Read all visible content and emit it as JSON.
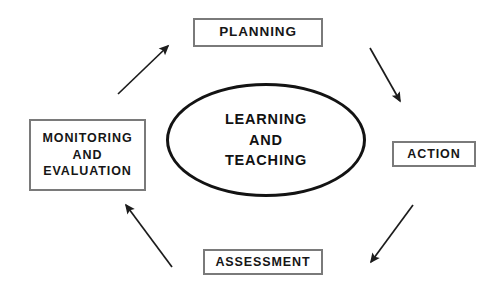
{
  "diagram": {
    "title_text": "Learning and teaching cycle",
    "background_color": "#ffffff",
    "box_border_color": "#7a7a7a",
    "ellipse_border_color": "#131313",
    "arrow_color": "#1c1c1c",
    "text_color": "#161616"
  },
  "center": {
    "name": "learning-and-teaching",
    "line1": "LEARNING",
    "line2": "AND",
    "line3": "TEACHING"
  },
  "nodes": {
    "planning": {
      "label": "PLANNING"
    },
    "action": {
      "label": "ACTION"
    },
    "assessment": {
      "label": "ASSESSMENT"
    },
    "monitoring": {
      "line1": "MONITORING",
      "line2": "AND",
      "line3": "EVALUATION"
    }
  },
  "arrows": [
    {
      "name": "arrow-monitoring-to-planning",
      "from": "MONITORING AND EVALUATION",
      "to": "PLANNING",
      "direction": "up-right"
    },
    {
      "name": "arrow-planning-to-action",
      "from": "PLANNING",
      "to": "ACTION",
      "direction": "down-right"
    },
    {
      "name": "arrow-action-to-assessment",
      "from": "ACTION",
      "to": "ASSESSMENT",
      "direction": "down-left"
    },
    {
      "name": "arrow-assessment-to-monitoring",
      "from": "ASSESSMENT",
      "to": "MONITORING AND EVALUATION",
      "direction": "up-left"
    }
  ]
}
